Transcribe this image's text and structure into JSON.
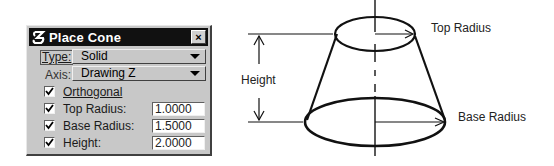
{
  "dialog": {
    "title": "Place Cone",
    "close_label": "×",
    "type": {
      "label": "Type:",
      "value": "Solid"
    },
    "axis": {
      "label": "Axis:",
      "value": "Drawing Z"
    },
    "orthogonal": {
      "label": "Orthogonal",
      "checked": true
    },
    "top_radius": {
      "label": "Top Radius:",
      "value": "1.0000",
      "checked": true
    },
    "base_radius": {
      "label": "Base Radius:",
      "value": "1.5000",
      "checked": true
    },
    "height": {
      "label": "Height:",
      "value": "2.0000",
      "checked": true
    }
  },
  "diagram": {
    "top_radius_label": "Top Radius",
    "base_radius_label": "Base Radius",
    "height_label": "Height"
  }
}
